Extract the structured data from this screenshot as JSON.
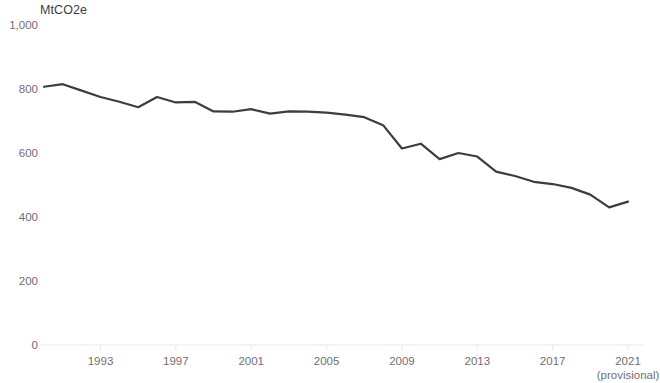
{
  "chart_data": {
    "type": "line",
    "title": "",
    "subtitle": "",
    "unit_label": "MtCO2e",
    "xlabel": "",
    "ylabel": "",
    "ylim": [
      0,
      1000
    ],
    "xlim": [
      1990,
      2021
    ],
    "grid": false,
    "legend": null,
    "line_color": "#3d3d3d",
    "axis_color": "#e8e8e8",
    "tick_text_color": "#6f6f6f",
    "y_ticks": [
      {
        "value": 0,
        "label": "0"
      },
      {
        "value": 200,
        "label": "200"
      },
      {
        "value": 400,
        "label": "400"
      },
      {
        "value": 600,
        "label": "600"
      },
      {
        "value": 800,
        "label": "800"
      },
      {
        "value": 1000,
        "label": "1,000"
      }
    ],
    "x_ticks": [
      {
        "value": 1993,
        "label": "1993",
        "sublabel": ""
      },
      {
        "value": 1997,
        "label": "1997",
        "sublabel": ""
      },
      {
        "value": 2001,
        "label": "2001",
        "sublabel": ""
      },
      {
        "value": 2005,
        "label": "2005",
        "sublabel": ""
      },
      {
        "value": 2009,
        "label": "2009",
        "sublabel": ""
      },
      {
        "value": 2013,
        "label": "2013",
        "sublabel": ""
      },
      {
        "value": 2017,
        "label": "2017",
        "sublabel": ""
      },
      {
        "value": 2021,
        "label": "2021",
        "sublabel": "(provisional)"
      }
    ],
    "x": [
      1990,
      1991,
      1992,
      1993,
      1994,
      1995,
      1996,
      1997,
      1998,
      1999,
      2000,
      2001,
      2002,
      2003,
      2004,
      2005,
      2006,
      2007,
      2008,
      2009,
      2010,
      2011,
      2012,
      2013,
      2014,
      2015,
      2016,
      2017,
      2018,
      2019,
      2020,
      2021
    ],
    "series": [
      {
        "name": "UK territorial greenhouse gas emissions",
        "values": [
          807,
          815,
          795,
          775,
          760,
          743,
          775,
          758,
          760,
          730,
          729,
          737,
          723,
          730,
          729,
          726,
          720,
          712,
          687,
          614,
          629,
          581,
          600,
          589,
          542,
          528,
          510,
          503,
          491,
          470,
          430,
          448
        ]
      }
    ]
  }
}
